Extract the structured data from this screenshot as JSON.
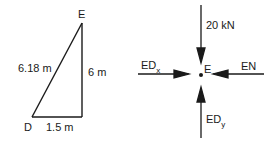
{
  "geometry": {
    "point_top": "E",
    "point_bottom_left": "D",
    "hypotenuse_label": "6.18 m",
    "vertical_label": "6 m",
    "horizontal_label": "1.5 m"
  },
  "fbd": {
    "point_label": "E",
    "top_force": "20 kN",
    "left_force": "ED",
    "left_force_sub": "x",
    "right_force": "EN",
    "bottom_force": "ED",
    "bottom_force_sub": "y"
  },
  "colors": {
    "ink": "#1a1a1a",
    "background": "#ffffff"
  }
}
